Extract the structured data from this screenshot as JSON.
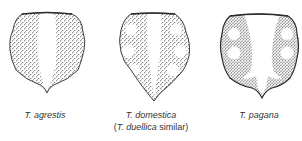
{
  "figure": {
    "specimens": [
      {
        "id": "agrestis",
        "genus_abbrev": "T.",
        "species": "agrestis",
        "label": "T. agrestis",
        "note": ""
      },
      {
        "id": "domestica",
        "genus_abbrev": "T.",
        "species": "domestica",
        "label": "T. domestica",
        "note_prefix": "(",
        "note_italic": "T. duellica",
        "note_suffix": " similar)"
      },
      {
        "id": "pagana",
        "genus_abbrev": "T.",
        "species": "pagana",
        "label": "T. pagana",
        "note": ""
      }
    ],
    "colors": {
      "background": "#ffffff",
      "outline": "#2a2a2a",
      "stipple": "#1e1e1e",
      "text": "#333333"
    }
  }
}
